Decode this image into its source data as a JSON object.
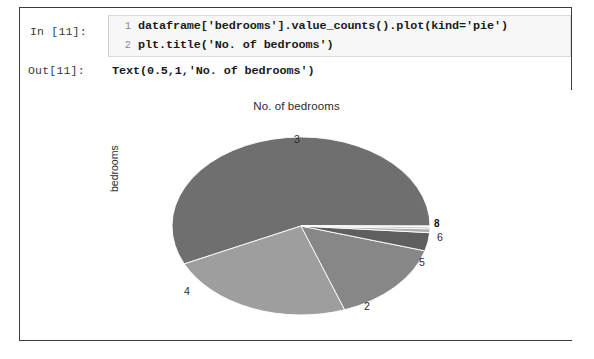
{
  "notebook": {
    "input_prompt": "In [11]:",
    "code_lines": [
      {
        "number": "1",
        "text": "dataframe['bedrooms'].value_counts().plot(kind='pie')"
      },
      {
        "number": "2",
        "text": "plt.title('No. of bedrooms')"
      }
    ],
    "output_prompt": "Out[11]:",
    "output_text": "Text(0.5,1,'No. of bedrooms')"
  },
  "chart_data": {
    "type": "pie",
    "title": "No. of bedrooms",
    "ylabel": "bedrooms",
    "xlabel": "",
    "legend": "none",
    "categories": [
      "3",
      "4",
      "2",
      "5",
      "6",
      "1",
      "8",
      "7"
    ],
    "values": [
      57.0,
      23.5,
      15.0,
      3.3,
      0.7,
      0.3,
      0.1,
      0.1
    ],
    "value_unit": "percent",
    "colors": [
      "#6f6f6f",
      "#9e9e9e",
      "#878787",
      "#5f5f5f",
      "#b0b0b0",
      "#707070",
      "#949494",
      "#7c7c7c"
    ],
    "wedge_labels": [
      {
        "name": "3",
        "text": "3",
        "x": 274,
        "y": 125
      },
      {
        "name": "4",
        "text": "4",
        "x": 164,
        "y": 277
      },
      {
        "name": "2",
        "text": "2",
        "x": 344,
        "y": 292
      },
      {
        "name": "5",
        "text": "5",
        "x": 399,
        "y": 248
      },
      {
        "name": "6",
        "text": "6",
        "x": 417,
        "y": 223
      },
      {
        "name": "crowded",
        "text": "8",
        "x": 414,
        "y": 210
      }
    ]
  }
}
